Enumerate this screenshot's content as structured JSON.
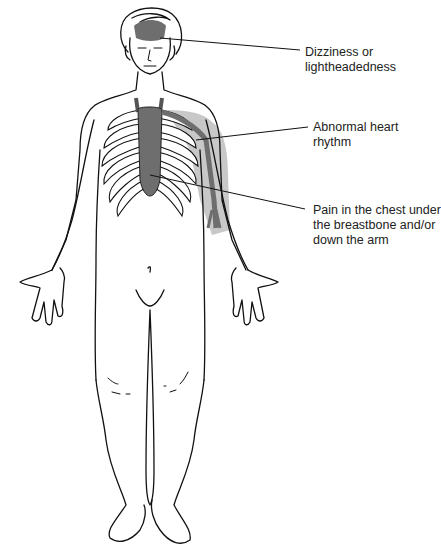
{
  "figure": {
    "type": "anatomical-illustration",
    "colors": {
      "line": "#111111",
      "highlight_dark": "#6e6e6e",
      "highlight_light": "#c8c8c8",
      "background": "#ffffff"
    },
    "regions": [
      {
        "id": "head",
        "shade": "dark",
        "description": "upper forehead / brain area"
      },
      {
        "id": "heart",
        "shade": "dark",
        "description": "heart and great vessels behind the sternum"
      },
      {
        "id": "left-arm",
        "shade": "light",
        "description": "left shoulder and upper arm with artery"
      }
    ]
  },
  "labels": [
    {
      "id": "dizziness",
      "lines": [
        "Dizziness or",
        "lightheadedness"
      ],
      "points_to": "head"
    },
    {
      "id": "rhythm",
      "lines": [
        "Abnormal heart",
        "rhythm"
      ],
      "points_to": "heart"
    },
    {
      "id": "pain",
      "lines": [
        "Pain in the chest under",
        "the breastbone and/or",
        "down the arm"
      ],
      "points_to": "chest-and-arm"
    }
  ]
}
